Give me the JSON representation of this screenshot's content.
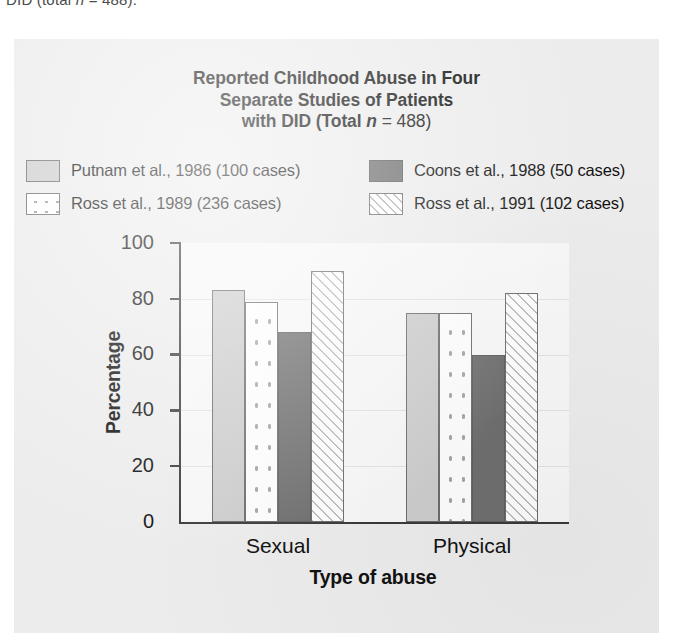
{
  "page": {
    "cutoff_text_above_figure": "DID (total n = 488)."
  },
  "figure": {
    "title_line1": "Reported Childhood Abuse in Four",
    "title_line2": "Separate Studies of Patients",
    "title_line3_prefix": "with DID (Total ",
    "title_line3_italic": "n",
    "title_line3_suffix": " = 488)",
    "background_color": "#ececec",
    "plot_background_color": "#f7f7f7",
    "axis_color": "#3a3a3a"
  },
  "legend": {
    "items": [
      {
        "label": "Putnam et al., 1986 (100 cases)",
        "pattern": "solid-light",
        "color": "#cdcdcd"
      },
      {
        "label": "Coons et al., 1988 (50 cases)",
        "pattern": "solid-dark",
        "color": "#6f6f6f"
      },
      {
        "label": "Ross et al., 1989 (236 cases)",
        "pattern": "dotted",
        "color": "#fdfdfd"
      },
      {
        "label": "Ross et al., 1991 (102 cases)",
        "pattern": "hatched",
        "color": "#fdfdfd"
      }
    ]
  },
  "chart_data": {
    "type": "bar",
    "title": "Reported Childhood Abuse in Four Separate Studies of Patients with DID (Total n = 488)",
    "xlabel": "Type of abuse",
    "ylabel": "Percentage",
    "categories": [
      "Sexual",
      "Physical"
    ],
    "ylim": [
      0,
      100
    ],
    "yticks": [
      0,
      20,
      40,
      60,
      80,
      100
    ],
    "ytick_labels": [
      "0",
      "20",
      "40",
      "60",
      "80",
      "100"
    ],
    "grid": true,
    "legend_position": "above-plot",
    "series": [
      {
        "name": "Putnam et al., 1986 (100 cases)",
        "pattern": "solid-light",
        "color": "#cdcdcd",
        "values": [
          83,
          75
        ]
      },
      {
        "name": "Ross et al., 1989 (236 cases)",
        "pattern": "dotted",
        "color": "#fdfdfd",
        "values": [
          79,
          75
        ]
      },
      {
        "name": "Coons et al., 1988 (50 cases)",
        "pattern": "solid-dark",
        "color": "#6f6f6f",
        "values": [
          68,
          60
        ]
      },
      {
        "name": "Ross et al., 1991 (102 cases)",
        "pattern": "hatched",
        "color": "#fdfdfd",
        "values": [
          90,
          82
        ]
      }
    ]
  }
}
